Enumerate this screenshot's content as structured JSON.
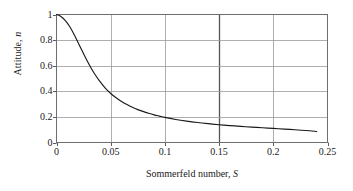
{
  "chart_data": {
    "type": "line",
    "title": "",
    "xlabel": "Sommerfeld number, S",
    "xlabel_text": "Sommerfeld number,",
    "xlabel_var": "S",
    "ylabel": "Attitude, n",
    "ylabel_text": "Attitude,",
    "ylabel_var": "n",
    "xlim": [
      0,
      0.25
    ],
    "ylim": [
      0,
      1
    ],
    "xticks": [
      "0",
      "0.05",
      "0.1",
      "0.15",
      "0.2",
      "0.25"
    ],
    "xtick_values": [
      0,
      0.05,
      0.1,
      0.15,
      0.2,
      0.25
    ],
    "yticks": [
      "0",
      "0.2",
      "0.4",
      "0.6",
      "0.8",
      "1"
    ],
    "ytick_values": [
      0,
      0.2,
      0.4,
      0.6,
      0.8,
      1
    ],
    "grid": true,
    "grid_color": "#9a9a9a",
    "emphasized_gridline_x": 0.15,
    "emphasized_gridline_color": "#555555",
    "frame_color": "#6e6e6e",
    "legend": null,
    "series": [
      {
        "name": "Attitude vs Sommerfeld number",
        "color": "#1a1a1a",
        "x": [
          0.0,
          0.004,
          0.008,
          0.012,
          0.016,
          0.02,
          0.024,
          0.028,
          0.032,
          0.036,
          0.04,
          0.045,
          0.05,
          0.055,
          0.06,
          0.065,
          0.07,
          0.075,
          0.08,
          0.085,
          0.09,
          0.095,
          0.1,
          0.11,
          0.12,
          0.13,
          0.14,
          0.15,
          0.16,
          0.17,
          0.18,
          0.19,
          0.2,
          0.21,
          0.22,
          0.23,
          0.24
        ],
        "y": [
          1.0,
          0.985,
          0.955,
          0.908,
          0.848,
          0.78,
          0.71,
          0.642,
          0.58,
          0.525,
          0.477,
          0.425,
          0.383,
          0.349,
          0.32,
          0.296,
          0.275,
          0.257,
          0.242,
          0.228,
          0.216,
          0.206,
          0.196,
          0.18,
          0.167,
          0.156,
          0.147,
          0.139,
          0.132,
          0.126,
          0.12,
          0.115,
          0.11,
          0.105,
          0.1,
          0.094,
          0.086
        ]
      }
    ]
  }
}
